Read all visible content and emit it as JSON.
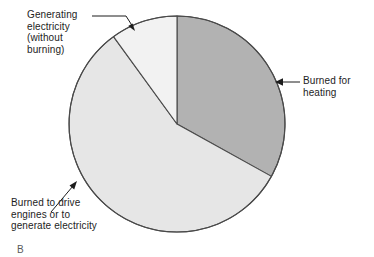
{
  "figure": {
    "caption_fragment": "B"
  },
  "chart_data": {
    "type": "pie",
    "title": "",
    "subtitle": "",
    "xlabel": "",
    "ylabel": "",
    "legend_position": "callout-labels",
    "grid": false,
    "center": {
      "x": 177,
      "y": 124
    },
    "radius": 108,
    "start_angle_deg": 0,
    "direction": "clockwise",
    "labels": [
      "Burned for heating",
      "Burned to drive engines or to generate electricity",
      "Generating electricity (without burning)"
    ],
    "values": [
      33,
      57,
      10
    ],
    "angles_deg": [
      119,
      205,
      36
    ],
    "colors": [
      "#b2b2b2",
      "#e6e6e6",
      "#f2f2f2"
    ],
    "slices": [
      {
        "name": "burned-for-heating",
        "label": "Burned for heating",
        "value": 33,
        "start_deg": 0,
        "end_deg": 119,
        "color": "#b2b2b2"
      },
      {
        "name": "burned-to-drive-engines",
        "label": "Burned to drive engines or to generate electricity",
        "value": 57,
        "start_deg": 119,
        "end_deg": 324,
        "color": "#e6e6e6"
      },
      {
        "name": "generating-electricity-without-burning",
        "label": "Generating electricity (without burning)",
        "value": 10,
        "start_deg": 324,
        "end_deg": 360,
        "color": "#f2f2f2"
      }
    ],
    "outline_color": "#4a4a4a"
  },
  "callouts": {
    "generating": {
      "line1": "Generating",
      "line2": "electricity",
      "line3": "(without",
      "line4": "burning)"
    },
    "heating": {
      "line1": "Burned for",
      "line2": "heating"
    },
    "engines": {
      "line1": "Burned to drive",
      "line2": "engines or to",
      "line3": "generate electricity"
    }
  }
}
